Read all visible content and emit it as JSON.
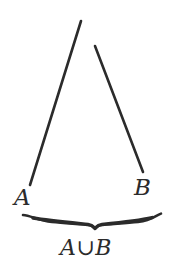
{
  "figure": {
    "background_color": "#ffffff",
    "ink_color": "#2b2b2b",
    "width": 172,
    "height": 276,
    "labels": {
      "left_set": "A",
      "right_set": "B",
      "union": "A∪B"
    },
    "strokes": {
      "left_segment": {
        "name": "set-a-segment",
        "x1": 81,
        "y1": 21,
        "x2": 30,
        "y2": 185,
        "width": 2.6
      },
      "right_segment": {
        "name": "set-b-segment",
        "x1": 95,
        "y1": 46,
        "x2": 143,
        "y2": 172,
        "width": 2.6
      },
      "underbrace": {
        "name": "union-underbrace",
        "left_tip_x": 23,
        "right_tip_x": 161,
        "top_y": 215,
        "center_x": 95,
        "center_y": 229,
        "width": 2.4
      }
    }
  }
}
